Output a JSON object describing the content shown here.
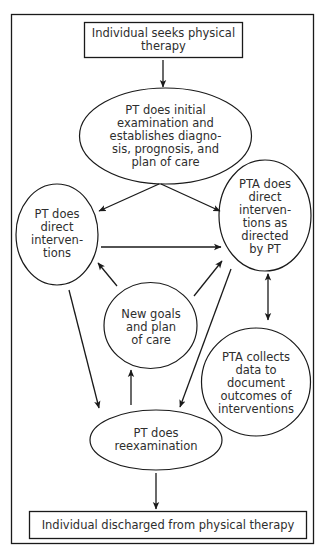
{
  "diagram": {
    "colors": {
      "stroke": "#1a1a1a",
      "text": "#2e2e2e",
      "background": "#ffffff"
    },
    "nodes": {
      "start": {
        "shape": "rectangle",
        "label": "Individual seeks physical\ntherapy"
      },
      "initial_exam": {
        "shape": "ellipse",
        "label": "PT does initial\nexamination and\nestablishes diagno-\nsis, prognosis, and\nplan of care"
      },
      "pt_interventions": {
        "shape": "ellipse",
        "label": "PT does\ndirect\ninterven-\ntions"
      },
      "pta_interventions": {
        "shape": "ellipse",
        "label": "PTA does\ndirect\ninterven-\ntions as\ndirected\nby PT"
      },
      "new_goals": {
        "shape": "circle",
        "label": "New goals\nand plan\nof care"
      },
      "pta_collects": {
        "shape": "circle",
        "label": "PTA collects\ndata to\ndocument\noutcomes of\ninterventions"
      },
      "reexam": {
        "shape": "ellipse",
        "label": "PT does\nreexamination"
      },
      "end": {
        "shape": "rectangle",
        "label": "Individual discharged from physical therapy"
      }
    },
    "edges": [
      {
        "from": "start",
        "to": "initial_exam",
        "type": "arrow"
      },
      {
        "from": "initial_exam",
        "to": "pt_interventions",
        "type": "arrow"
      },
      {
        "from": "initial_exam",
        "to": "pta_interventions",
        "type": "arrow"
      },
      {
        "from": "pt_interventions",
        "to": "pta_interventions",
        "type": "arrow"
      },
      {
        "from": "pt_interventions",
        "to": "reexam",
        "type": "arrow"
      },
      {
        "from": "new_goals",
        "to": "pt_interventions",
        "type": "arrow"
      },
      {
        "from": "new_goals",
        "to": "pta_interventions",
        "type": "arrow"
      },
      {
        "from": "pta_interventions",
        "to": "reexam",
        "type": "arrow"
      },
      {
        "from": "pta_interventions",
        "to": "pta_collects",
        "type": "double-arrow"
      },
      {
        "from": "reexam",
        "to": "new_goals",
        "type": "arrow"
      },
      {
        "from": "reexam",
        "to": "end",
        "type": "arrow"
      }
    ]
  }
}
